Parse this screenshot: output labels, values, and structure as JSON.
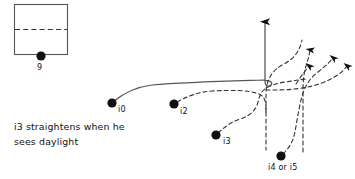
{
  "diagram": {
    "background_color": "#ffffff",
    "ink_color": "#111111",
    "line_color": "#555555",
    "formation_box": {
      "name": "formation-box",
      "x": 14,
      "y": 4,
      "width": 53,
      "height": 50,
      "divider": "dashed-horizontal"
    },
    "players": [
      {
        "id": "p9",
        "label": "9",
        "cx": 41,
        "cy": 56,
        "label_x": 37,
        "label_y": 70
      },
      {
        "id": "p10",
        "label": "i0",
        "cx": 112,
        "cy": 103,
        "label_x": 118,
        "label_y": 112
      },
      {
        "id": "p12",
        "label": "i2",
        "cx": 174,
        "cy": 104,
        "label_x": 180,
        "label_y": 114
      },
      {
        "id": "p13",
        "label": "i3",
        "cx": 216,
        "cy": 135,
        "label_x": 223,
        "label_y": 143
      },
      {
        "id": "p14",
        "label": "i4 or i5",
        "cx": 281,
        "cy": 156,
        "label_x": 268,
        "label_y": 170
      }
    ],
    "note": {
      "name": "play-note",
      "text": "i3 straightens when he\nsees daylight"
    },
    "routes": [
      {
        "id": "r10",
        "player": "i0",
        "style": "solid",
        "arrow": "up"
      },
      {
        "id": "r12",
        "player": "i2",
        "style": "dashed",
        "arrow": "up"
      },
      {
        "id": "r13",
        "player": "i3",
        "style": "dashed",
        "arrow": "up-right"
      },
      {
        "id": "r14",
        "player": "i4 or i5",
        "style": "dashed",
        "arrow": "up-right"
      }
    ]
  }
}
